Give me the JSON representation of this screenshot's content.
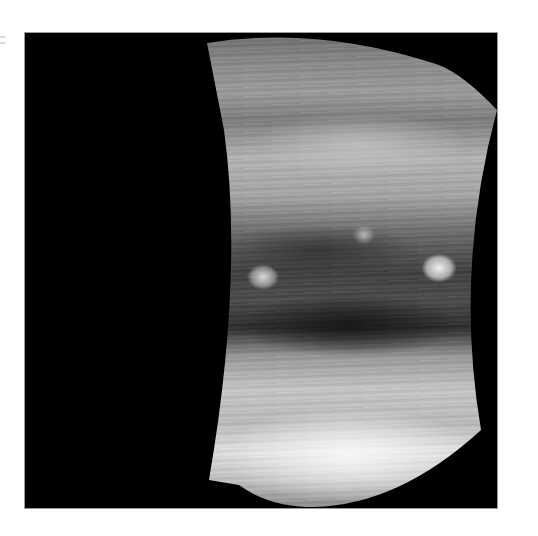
{
  "image": {
    "subject": "Jupiter",
    "description": "Grayscale spacecraft image of Jupiter's cloud bands with swirling turbulent belts and two bright white oval storms against a black background",
    "background_color": "#000000",
    "page_background": "#ffffff",
    "features": [
      {
        "name": "white-oval-storm-right",
        "approx_x": 415,
        "approx_y": 265
      },
      {
        "name": "white-oval-storm-left",
        "approx_x": 240,
        "approx_y": 273
      },
      {
        "name": "dark-belt",
        "approx_y": 300
      },
      {
        "name": "bright-southern-zone",
        "approx_y": 450
      }
    ]
  }
}
